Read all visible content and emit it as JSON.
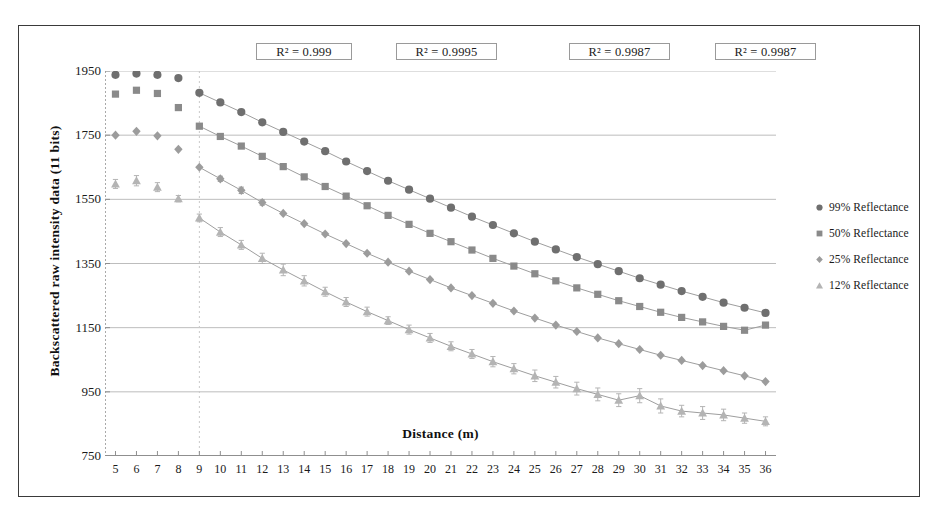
{
  "figure": {
    "caption_present": false
  },
  "annotations": {
    "r2_labels": [
      {
        "text": "R² = 0.999",
        "x": 255,
        "width": 96
      },
      {
        "text": "R² = 0.9995",
        "x": 395,
        "width": 101
      },
      {
        "text": "R² = 0.9987",
        "x": 568,
        "width": 101
      },
      {
        "text": "R² = 0.9987",
        "x": 714,
        "width": 101
      }
    ]
  },
  "legend": {
    "position": "right",
    "items": [
      {
        "label": "99% Reflectance",
        "marker": "circle",
        "color": "#6f6f6f"
      },
      {
        "label": "50% Reflectance",
        "marker": "square",
        "color": "#8a8a8a"
      },
      {
        "label": "25% Reflectance",
        "marker": "diamond",
        "color": "#9c9c9c"
      },
      {
        "label": "12% Reflectance",
        "marker": "triangle",
        "color": "#b4b4b4"
      }
    ]
  },
  "chart_data": {
    "type": "scatter",
    "title": "",
    "xlabel": "Distance (m)",
    "ylabel": "Backscattered  raw intensity data (11 bits)",
    "xlim": [
      4.5,
      36.5
    ],
    "ylim": [
      750,
      1950
    ],
    "yticks": [
      750,
      950,
      1150,
      1350,
      1550,
      1750,
      1950
    ],
    "xticks": [
      5,
      6,
      7,
      8,
      9,
      10,
      11,
      12,
      13,
      14,
      15,
      16,
      17,
      18,
      19,
      20,
      21,
      22,
      23,
      24,
      25,
      26,
      27,
      28,
      29,
      30,
      31,
      32,
      33,
      34,
      35,
      36
    ],
    "grid": true,
    "grid_axis": "y",
    "vertical_divider_x": 9,
    "x": [
      5,
      6,
      7,
      8,
      9,
      10,
      11,
      12,
      13,
      14,
      15,
      16,
      17,
      18,
      19,
      20,
      21,
      22,
      23,
      24,
      25,
      26,
      27,
      28,
      29,
      30,
      31,
      32,
      33,
      34,
      35,
      36
    ],
    "series": [
      {
        "name": "99% Reflectance",
        "marker": "circle",
        "color": "#6f6f6f",
        "fit_line": true,
        "fit_from_x": 9,
        "values": [
          1938,
          1942,
          1938,
          1928,
          1882,
          1852,
          1822,
          1790,
          1760,
          1730,
          1700,
          1668,
          1638,
          1608,
          1580,
          1552,
          1524,
          1496,
          1470,
          1444,
          1418,
          1394,
          1370,
          1348,
          1326,
          1304,
          1284,
          1264,
          1246,
          1228,
          1212,
          1196
        ],
        "errors": [
          0,
          0,
          0,
          0,
          0,
          0,
          0,
          0,
          0,
          0,
          0,
          0,
          0,
          0,
          0,
          0,
          0,
          0,
          0,
          0,
          0,
          0,
          0,
          0,
          0,
          0,
          0,
          0,
          0,
          0,
          0,
          0
        ]
      },
      {
        "name": "50% Reflectance",
        "marker": "square",
        "color": "#8a8a8a",
        "fit_line": true,
        "fit_from_x": 9,
        "values": [
          1878,
          1890,
          1880,
          1836,
          1778,
          1746,
          1716,
          1684,
          1652,
          1620,
          1590,
          1560,
          1530,
          1500,
          1472,
          1444,
          1418,
          1392,
          1366,
          1342,
          1318,
          1296,
          1274,
          1254,
          1234,
          1216,
          1198,
          1182,
          1168,
          1154,
          1142,
          1158
        ],
        "errors": [
          0,
          0,
          0,
          0,
          0,
          0,
          0,
          0,
          0,
          0,
          0,
          0,
          0,
          0,
          0,
          0,
          0,
          0,
          0,
          0,
          0,
          0,
          0,
          0,
          0,
          0,
          0,
          0,
          0,
          0,
          0,
          0
        ]
      },
      {
        "name": "25% Reflectance",
        "marker": "diamond",
        "color": "#9c9c9c",
        "fit_line": true,
        "fit_from_x": 9,
        "values": [
          1750,
          1762,
          1748,
          1706,
          1650,
          1614,
          1578,
          1540,
          1506,
          1474,
          1442,
          1412,
          1382,
          1354,
          1326,
          1300,
          1274,
          1250,
          1226,
          1202,
          1180,
          1158,
          1138,
          1118,
          1100,
          1082,
          1064,
          1048,
          1032,
          1016,
          1000,
          982
        ],
        "errors": [
          0,
          0,
          0,
          0,
          0,
          8,
          10,
          8,
          0,
          0,
          0,
          0,
          0,
          0,
          0,
          0,
          0,
          0,
          0,
          0,
          0,
          0,
          0,
          0,
          0,
          0,
          0,
          0,
          0,
          0,
          0,
          0
        ]
      },
      {
        "name": "12% Reflectance",
        "marker": "triangle",
        "color": "#b4b4b4",
        "fit_line": true,
        "fit_from_x": 9,
        "values": [
          1598,
          1608,
          1588,
          1552,
          1492,
          1448,
          1408,
          1366,
          1330,
          1296,
          1262,
          1230,
          1200,
          1172,
          1144,
          1118,
          1092,
          1068,
          1044,
          1022,
          1000,
          980,
          960,
          942,
          924,
          938,
          906,
          890,
          884,
          878,
          868,
          858
        ],
        "errors": [
          14,
          16,
          14,
          10,
          12,
          14,
          14,
          16,
          18,
          16,
          14,
          14,
          14,
          12,
          14,
          14,
          14,
          14,
          16,
          16,
          18,
          18,
          20,
          20,
          20,
          22,
          22,
          18,
          20,
          18,
          16,
          14
        ]
      }
    ]
  },
  "style": {
    "frame_color": "#3a3a3a",
    "grid_color": "#bdbdbd",
    "axis_color": "#a9a9a9",
    "text_color": "#1a1a1a"
  }
}
